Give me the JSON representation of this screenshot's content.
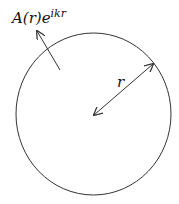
{
  "diagram": {
    "wave_label": {
      "base": "A(r)e",
      "exponent": "ikr"
    },
    "radius_label": "r",
    "circle": {
      "cx": 93.5,
      "cy": 114,
      "rx": 77.5,
      "ry": 81
    },
    "colors": {
      "stroke": "#333333",
      "text": "#111111"
    }
  }
}
